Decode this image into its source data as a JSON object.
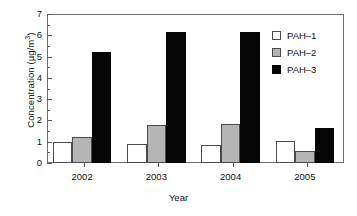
{
  "chart_data": {
    "type": "bar",
    "title": "",
    "subtitle": "",
    "xlabel": "Year",
    "ylabel": "Concentration (µg/m³)",
    "ylabel_base": "Concentration (µg/m",
    "ylabel_sup": "3",
    "ylabel_tail": ")",
    "categories": [
      "2002",
      "2003",
      "2004",
      "2005"
    ],
    "series": [
      {
        "name": "PAH–1",
        "color": "#ffffff",
        "values": [
          1.0,
          0.87,
          0.86,
          1.05
        ]
      },
      {
        "name": "PAH–2",
        "color": "#b5b5b5",
        "values": [
          1.2,
          1.8,
          1.85,
          0.55
        ]
      },
      {
        "name": "PAH–3",
        "color": "#050505",
        "values": [
          5.22,
          6.17,
          6.17,
          1.65
        ]
      }
    ],
    "ylim": [
      0,
      7
    ],
    "ytick_values": [
      "0",
      "1",
      "2",
      "3",
      "4",
      "5",
      "6",
      "7"
    ],
    "yminor_step": 0.5,
    "grid": false,
    "legend_position": "top-right",
    "axis_color": "#6d6d6d"
  },
  "legend": {
    "entries": [
      {
        "label": "PAH–1"
      },
      {
        "label": "PAH–2"
      },
      {
        "label": "PAH–3"
      }
    ]
  },
  "caption": {
    "text": ""
  }
}
